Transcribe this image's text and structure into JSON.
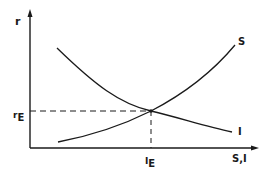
{
  "diagram": {
    "type": "economics supply-demand style curves",
    "y_axis_label": "r",
    "x_axis_label": "S,I",
    "curves": [
      {
        "name": "S",
        "label": "S",
        "description": "upward sloping savings curve"
      },
      {
        "name": "I",
        "label": "I",
        "description": "downward sloping investment curve"
      }
    ],
    "equilibrium": {
      "y_label_main": "r",
      "y_label_sub": "E",
      "x_label_main": "I",
      "x_label_sub": "E"
    },
    "colors": {
      "line": "#1a1a1a",
      "background": "#ffffff"
    }
  }
}
